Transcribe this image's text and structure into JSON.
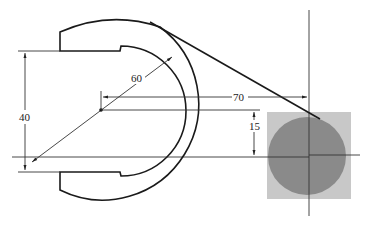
{
  "diagram": {
    "type": "engineering drawing - wrench jaw with circle",
    "dimensions": {
      "height_label": "40",
      "radius_label": "60",
      "horizontal_label": "70",
      "offset_label": "15"
    },
    "colors": {
      "line": "#1a1a1a",
      "square_fill": "#c8c8c8",
      "circle_fill": "#8a8a8a",
      "background": "#ffffff"
    }
  }
}
